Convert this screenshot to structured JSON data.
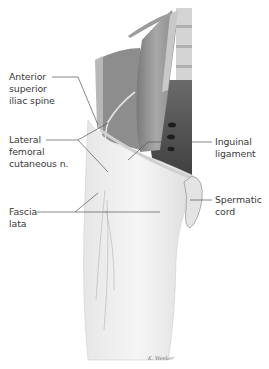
{
  "figure": {
    "colors": {
      "muscle_dark": "#6f6f6f",
      "muscle_mid": "#9a9a9a",
      "muscle_light": "#c4c4c4",
      "fascia": "#ececec",
      "spine": "#d9d9d9",
      "pelvis_shadow": "#4a4a4a",
      "leader_line": "#555555",
      "text": "#3a3a3a"
    },
    "labels": [
      {
        "id": "asis",
        "lines": [
          "Anterior",
          "superior",
          "iliac spine"
        ],
        "side": "left"
      },
      {
        "id": "lfcn",
        "lines": [
          "Lateral",
          "femoral",
          "cutaneous n."
        ],
        "side": "left"
      },
      {
        "id": "fascia",
        "lines": [
          "Fascia",
          "lata"
        ],
        "side": "left"
      },
      {
        "id": "inguinal",
        "lines": [
          "Inguinal",
          "ligament"
        ],
        "side": "right"
      },
      {
        "id": "spermatic",
        "lines": [
          "Spermatic",
          "cord"
        ],
        "side": "right"
      }
    ],
    "signature": "K. Wesker"
  }
}
